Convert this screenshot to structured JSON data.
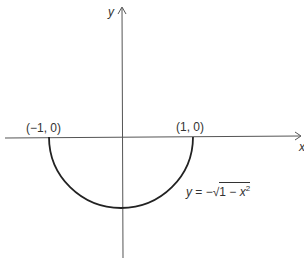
{
  "diagram": {
    "type": "function-graph",
    "axes": {
      "x_label": "x",
      "y_label": "y"
    },
    "points": [
      {
        "label": "(−1, 0)",
        "x": -1,
        "y": 0
      },
      {
        "label": "(1, 0)",
        "x": 1,
        "y": 0
      }
    ],
    "curve": {
      "equation_lhs": "y",
      "equation_eq": " = −",
      "sqrt_symbol": "√",
      "radicand_text": "1 − ",
      "radicand_var": "x",
      "radicand_exp": "2",
      "domain": [
        -1,
        1
      ],
      "range": [
        -1,
        0
      ]
    },
    "colors": {
      "axis": "#555555",
      "curve": "#222222",
      "text": "#333333"
    }
  }
}
